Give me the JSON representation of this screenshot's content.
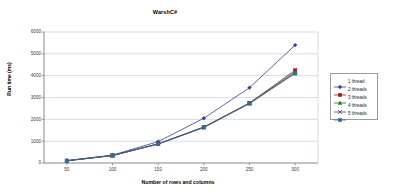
{
  "chart_data": {
    "type": "line",
    "title": "WarshC#",
    "xlabel": "Number of rows and columns",
    "ylabel": "Run time (ms)",
    "x": [
      50,
      100,
      150,
      200,
      250,
      300
    ],
    "xtick_labels": [
      "50",
      "100",
      "150",
      "200",
      "250",
      "300"
    ],
    "ytick_labels": [
      "0",
      "1000",
      "2000",
      "3000",
      "4000",
      "5000",
      "6000"
    ],
    "yticks": [
      0,
      1000,
      2000,
      3000,
      4000,
      5000,
      6000
    ],
    "xlim": [
      25,
      325
    ],
    "ylim": [
      0,
      6000
    ],
    "grid": "horizontal",
    "legend_position": "right",
    "series": [
      {
        "name": "1 thread",
        "marker": "diamond",
        "color": "#3b3b8f",
        "values": [
          110,
          360,
          980,
          2050,
          3450,
          5400
        ]
      },
      {
        "name": "2 threads",
        "marker": "square",
        "color": "#9b1c1c",
        "values": [
          105,
          345,
          880,
          1650,
          2750,
          4250
        ]
      },
      {
        "name": "3 threads",
        "marker": "triangle",
        "color": "#2f6b2f",
        "values": [
          105,
          345,
          875,
          1640,
          2740,
          4180
        ]
      },
      {
        "name": "4 threads",
        "marker": "cross",
        "color": "#5b3f8f",
        "values": [
          100,
          340,
          870,
          1630,
          2730,
          4130
        ]
      },
      {
        "name": "5 threads",
        "marker": "square",
        "color": "#2f6f8f",
        "values": [
          100,
          340,
          865,
          1625,
          2720,
          4100
        ]
      }
    ]
  },
  "legend": {
    "items": [
      {
        "label": "1 thread"
      },
      {
        "label": "2 threads"
      },
      {
        "label": "3 threads"
      },
      {
        "label": "4 threads"
      },
      {
        "label": "5 threads"
      }
    ]
  }
}
